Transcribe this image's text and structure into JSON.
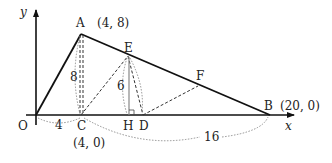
{
  "axes": {
    "x_label": "x",
    "y_label": "y",
    "origin_label": "O"
  },
  "points": {
    "A": {
      "label": "A",
      "coord_label": "(4,  8)"
    },
    "B": {
      "label": "B",
      "coord_label": "(20,  0)"
    },
    "C": {
      "label": "C",
      "coord_label": "(4,  0)"
    },
    "D": {
      "label": "D"
    },
    "E": {
      "label": "E"
    },
    "F": {
      "label": "F"
    },
    "H": {
      "label": "H"
    }
  },
  "lengths": {
    "AC": "8",
    "EH": "6",
    "OC": "4",
    "CB": "16"
  },
  "colors": {
    "line": "#111111",
    "dashed": "#333333",
    "dotted": "#777777"
  }
}
